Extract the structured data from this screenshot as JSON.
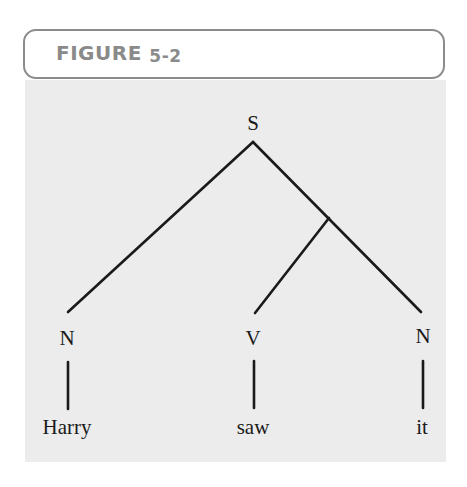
{
  "figure": {
    "label_word": "FIGURE",
    "label_number": "5-2",
    "colors": {
      "header_border": "#8c8c8c",
      "header_text": "#8a8a8a",
      "panel_background": "#ececec",
      "line": "#1a1a1a"
    }
  },
  "tree": {
    "root": {
      "label": "S"
    },
    "categories": [
      {
        "label": "N"
      },
      {
        "label": "V"
      },
      {
        "label": "N"
      }
    ],
    "words": [
      {
        "label": "Harry"
      },
      {
        "label": "saw"
      },
      {
        "label": "it"
      }
    ],
    "structure": "[S [N Harry] [[V saw] [N it]]]"
  }
}
